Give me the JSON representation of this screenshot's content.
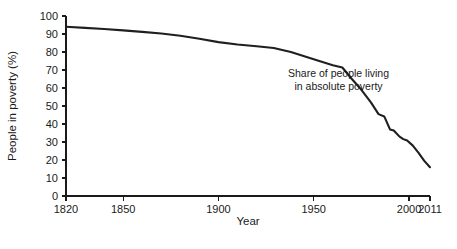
{
  "chart_data": {
    "type": "line",
    "title": "",
    "xlabel": "Year",
    "ylabel": "People in poverty (%)",
    "xlim": [
      1820,
      2011
    ],
    "ylim": [
      0,
      100
    ],
    "grid": false,
    "legend": null,
    "xticks": [
      1820,
      1850,
      1900,
      1950,
      2000,
      2011
    ],
    "xtick_labels": [
      "1820",
      "1850",
      "1900",
      "1950",
      "2000",
      "2011"
    ],
    "yticks": [
      0,
      10,
      20,
      30,
      40,
      50,
      60,
      70,
      80,
      90,
      100
    ],
    "ytick_labels": [
      "0",
      "10",
      "20",
      "30",
      "40",
      "50",
      "60",
      "70",
      "80",
      "90",
      "100"
    ],
    "annotations": [
      {
        "name": "series-annotation",
        "lines": [
          "Share of people living",
          "in absolute poverty"
        ],
        "x": 1963,
        "y": 66
      }
    ],
    "series": [
      {
        "name": "Share of people living in absolute poverty",
        "color": "#1f1f1f",
        "x": [
          1820,
          1830,
          1840,
          1850,
          1860,
          1870,
          1880,
          1890,
          1900,
          1910,
          1920,
          1929,
          1938,
          1950,
          1960,
          1965,
          1970,
          1975,
          1980,
          1984,
          1987,
          1990,
          1992,
          1995,
          1997,
          1999,
          2002,
          2005,
          2008,
          2011
        ],
        "y": [
          94.0,
          93.4,
          92.8,
          92.0,
          91.2,
          90.3,
          89.0,
          87.4,
          85.5,
          84.2,
          83.2,
          82.2,
          80.0,
          76.0,
          72.6,
          71.4,
          65.0,
          59.0,
          52.0,
          45.5,
          44.2,
          37.0,
          36.4,
          33.0,
          31.6,
          30.8,
          28.0,
          24.0,
          19.5,
          16.0
        ]
      }
    ]
  }
}
